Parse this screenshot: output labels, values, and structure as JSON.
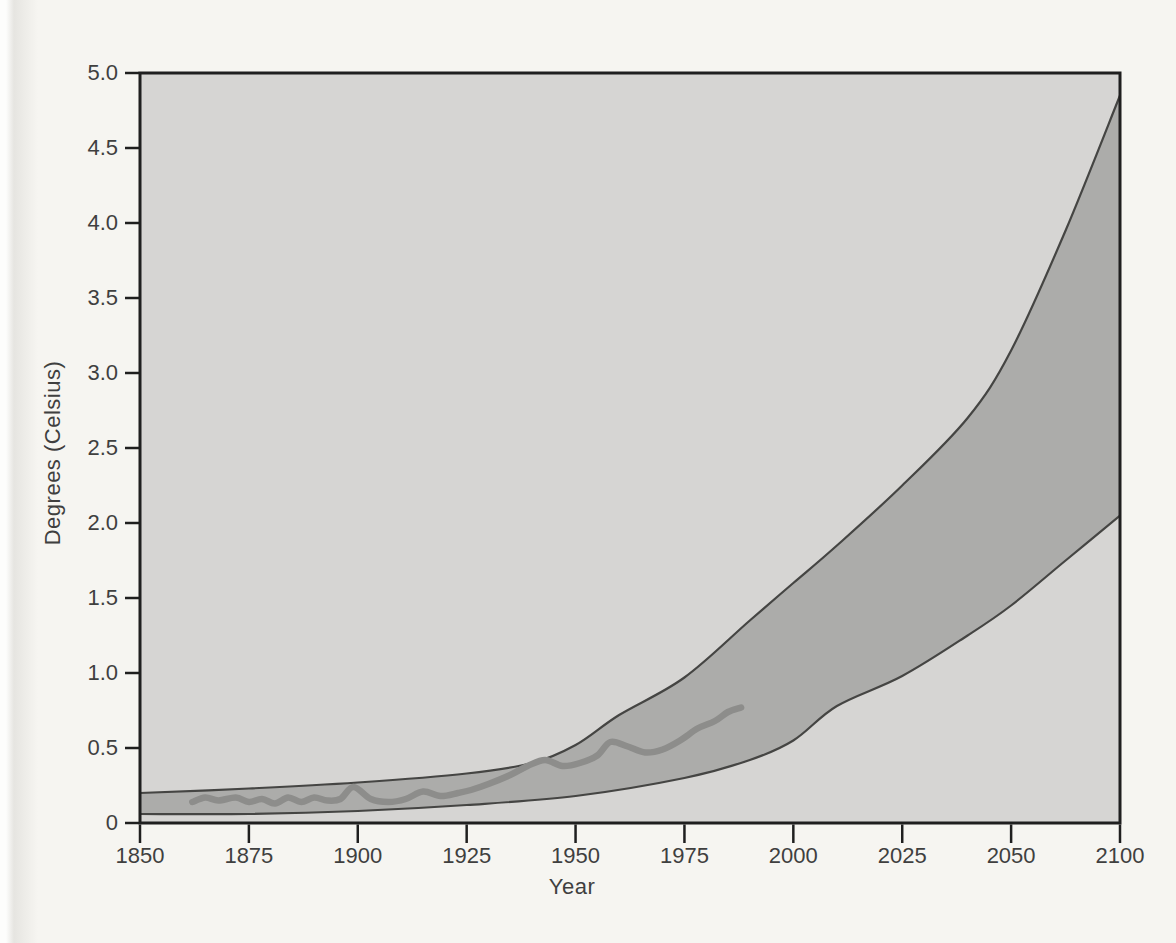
{
  "figure": {
    "xlabel": "Year",
    "ylabel": "Degrees (Celsius)"
  },
  "chart_data": {
    "type": "area",
    "title": "",
    "xlabel": "Year",
    "ylabel": "Degrees (Celsius)",
    "ylim": [
      0,
      5.0
    ],
    "x_axis": {
      "tick_labels": [
        "1850",
        "1875",
        "1900",
        "1925",
        "1950",
        "1975",
        "2000",
        "2025",
        "2050",
        "2100"
      ],
      "tick_years": [
        1850,
        1875,
        1900,
        1925,
        1950,
        1975,
        2000,
        2025,
        2050,
        2100
      ],
      "note": "ticks evenly spaced; final interval jumps from 2050 to 2100 (2075 not labeled)"
    },
    "y_axis": {
      "tick_labels": [
        "5.0",
        "4.5",
        "4.0",
        "3.5",
        "3.0",
        "2.5",
        "2.0",
        "1.5",
        "1.0",
        "0.5",
        "0"
      ],
      "tick_values": [
        5.0,
        4.5,
        4.0,
        3.5,
        3.0,
        2.5,
        2.0,
        1.5,
        1.0,
        0.5,
        0
      ]
    },
    "grid": false,
    "legend": null,
    "series": [
      {
        "name": "projected-upper-bound",
        "style": "band-edge",
        "years": [
          1850,
          1875,
          1900,
          1925,
          1940,
          1950,
          1960,
          1975,
          1990,
          2000,
          2010,
          2025,
          2040,
          2050,
          2075,
          2100
        ],
        "values": [
          0.2,
          0.23,
          0.27,
          0.33,
          0.4,
          0.52,
          0.72,
          0.97,
          1.35,
          1.6,
          1.85,
          2.25,
          2.7,
          3.15,
          3.95,
          4.85
        ]
      },
      {
        "name": "projected-lower-bound",
        "style": "band-edge",
        "years": [
          1850,
          1875,
          1900,
          1925,
          1950,
          1975,
          1990,
          2000,
          2010,
          2025,
          2040,
          2050,
          2075,
          2100
        ],
        "values": [
          0.06,
          0.06,
          0.08,
          0.12,
          0.18,
          0.3,
          0.42,
          0.55,
          0.78,
          0.98,
          1.25,
          1.45,
          1.75,
          2.05
        ]
      },
      {
        "name": "observed-temperature",
        "style": "thick-line",
        "years": [
          1862,
          1865,
          1868,
          1872,
          1875,
          1878,
          1881,
          1884,
          1887,
          1890,
          1893,
          1896,
          1899,
          1903,
          1907,
          1911,
          1915,
          1919,
          1923,
          1926,
          1930,
          1935,
          1939,
          1943,
          1947,
          1951,
          1955,
          1958,
          1962,
          1966,
          1970,
          1974,
          1978,
          1982,
          1985,
          1988
        ],
        "values": [
          0.14,
          0.17,
          0.15,
          0.17,
          0.14,
          0.16,
          0.13,
          0.17,
          0.14,
          0.17,
          0.15,
          0.16,
          0.24,
          0.16,
          0.14,
          0.16,
          0.21,
          0.18,
          0.2,
          0.22,
          0.26,
          0.32,
          0.38,
          0.42,
          0.38,
          0.4,
          0.45,
          0.54,
          0.51,
          0.47,
          0.49,
          0.55,
          0.63,
          0.68,
          0.74,
          0.77
        ]
      }
    ],
    "colors": {
      "paper_background": "#f6f5f1",
      "plot_background": "#d6d5d3",
      "band_fill": "#acacaa",
      "band_edge": "#454543",
      "observed_line": "#8d8d8b",
      "axis_frame": "#1f1f1f",
      "text": "#3f3f3f"
    }
  }
}
